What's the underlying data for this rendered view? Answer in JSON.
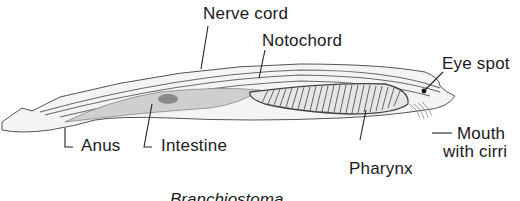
{
  "diagram": {
    "caption": "Branchiostoma",
    "labels": [
      {
        "id": "nerve-cord",
        "text": "Nerve cord"
      },
      {
        "id": "notochord",
        "text": "Notochord"
      },
      {
        "id": "eye-spot",
        "text": "Eye spot"
      },
      {
        "id": "mouth",
        "text_line1": "Mouth",
        "text_line2": "with cirri"
      },
      {
        "id": "pharynx",
        "text": "Pharynx"
      },
      {
        "id": "intestine",
        "text": "Intestine"
      },
      {
        "id": "anus",
        "text": "Anus"
      }
    ],
    "colors": {
      "ink": "#1a1a1a",
      "line": "#333333",
      "body_shade": "#bdbdbd",
      "background": "#ffffff"
    }
  }
}
